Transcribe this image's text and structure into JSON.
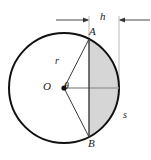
{
  "figure": {
    "type": "geometry-diagram",
    "background_color": "#ffffff",
    "stroke_color": "#1a1a1a",
    "segment_fill_color": "#d4d4d4",
    "guide_color": "#9a9a9a",
    "labels": {
      "point_a": "A",
      "point_b": "B",
      "center": "O",
      "angle": "θ",
      "radius": "r",
      "arc": "s",
      "height": "h"
    },
    "geometry": {
      "circle_center_x": 64,
      "circle_center_y": 88,
      "circle_radius": 55,
      "chord_x": 89,
      "point_a_x": 89,
      "point_a_y": 39,
      "point_b_x": 89,
      "point_b_y": 137,
      "segment_height_px": 30
    },
    "dimension_line": {
      "label": "h",
      "y": 20,
      "left_tick_x": 89,
      "right_tick_x": 119,
      "left_arrow_start_x": 56,
      "right_arrow_start_x": 150
    }
  }
}
